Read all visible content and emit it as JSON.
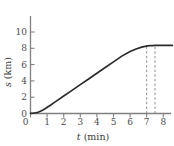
{
  "chart_data": {
    "type": "line",
    "title": "",
    "xlabel": "t (min)",
    "ylabel": "s (km)",
    "xlabel_var": "t",
    "xlabel_unit": "(min)",
    "ylabel_var": "s",
    "ylabel_unit": "(km)",
    "xlim": [
      0,
      8.6
    ],
    "ylim": [
      0,
      10.4
    ],
    "xticks": [
      0,
      1,
      2,
      3,
      4,
      5,
      6,
      7,
      8
    ],
    "xtick_labels": [
      "0",
      "1",
      "2",
      "3",
      "4",
      "5",
      "6",
      "7",
      "8"
    ],
    "yticks": [
      0,
      2,
      4,
      6,
      8,
      10
    ],
    "ytick_labels": [
      "0",
      "2",
      "4",
      "6",
      "8",
      "10"
    ],
    "grid": false,
    "legend": null,
    "series": [
      {
        "name": "distance",
        "x": [
          0.0,
          0.15,
          0.3,
          0.45,
          0.6,
          0.75,
          0.9,
          1.05,
          1.2,
          1.4,
          1.6,
          2.0,
          2.5,
          3.0,
          3.5,
          4.0,
          4.5,
          5.0,
          5.5,
          6.0,
          6.4,
          6.7,
          6.9,
          7.05,
          7.2,
          7.35,
          7.5,
          7.7,
          8.0,
          8.3,
          8.55
        ],
        "y": [
          0.02,
          0.04,
          0.08,
          0.16,
          0.28,
          0.44,
          0.62,
          0.82,
          1.02,
          1.3,
          1.58,
          2.14,
          2.84,
          3.54,
          4.24,
          4.94,
          5.64,
          6.34,
          7.04,
          7.6,
          7.95,
          8.15,
          8.24,
          8.3,
          8.33,
          8.34,
          8.35,
          8.35,
          8.35,
          8.35,
          8.35
        ]
      }
    ],
    "annotations": [
      {
        "type": "vertical-dashed-line",
        "x": 7.0,
        "y_from": 0,
        "y_to": 8.3
      },
      {
        "type": "vertical-dashed-line",
        "x": 7.5,
        "y_from": 0,
        "y_to": 8.35
      }
    ],
    "plateau_value": 8.35,
    "colors": {
      "curve": "#2b2b2b",
      "axis": "#808080",
      "dashed": "#8c8c8c",
      "tick_label": "#4d4d4d",
      "background": "#ffffff"
    }
  }
}
